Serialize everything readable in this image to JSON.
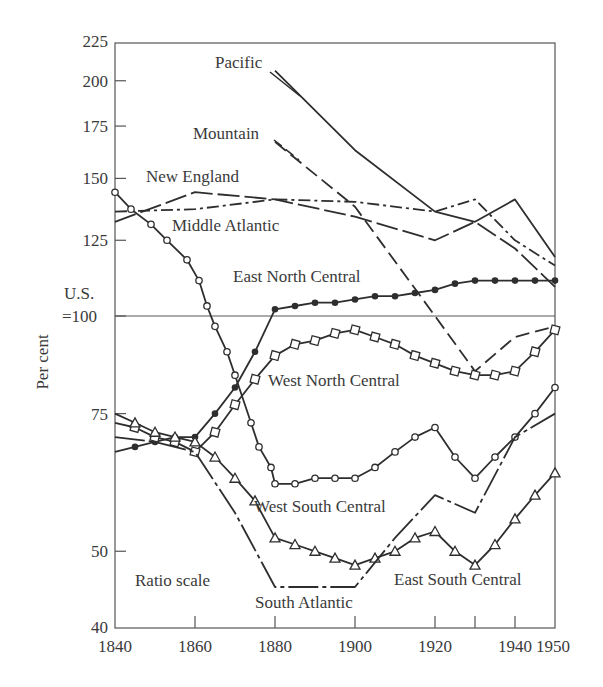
{
  "chart_data": {
    "type": "line",
    "title": "",
    "xlabel": "",
    "ylabel": "Per cent",
    "y_scale": "log",
    "scale_note": "Ratio scale",
    "reference_line": {
      "value": 100,
      "label_line1": "U.S.",
      "label_line2": "=100"
    },
    "xlim": [
      1840,
      1950
    ],
    "ylim": [
      40,
      225
    ],
    "x_ticks": [
      1840,
      1860,
      1880,
      1900,
      1920,
      1930,
      1940,
      1950
    ],
    "x_tick_labels": [
      "1840",
      "1860",
      "1880",
      "1900",
      "1920",
      "",
      "1940",
      "1950"
    ],
    "y_ticks": [
      40,
      50,
      75,
      100,
      125,
      150,
      175,
      200,
      225
    ],
    "y_tick_labels": [
      "40",
      "50",
      "75",
      "",
      "125",
      "150",
      "175",
      "200",
      "225"
    ],
    "grid": false,
    "legend": "inline labels",
    "series": [
      {
        "name": "Pacific",
        "style": "solid",
        "marker": "none",
        "x": [
          1880,
          1900,
          1920,
          1930,
          1940,
          1950
        ],
        "values": [
          206,
          163,
          136,
          132,
          141,
          119
        ]
      },
      {
        "name": "Mountain",
        "style": "long-dash",
        "marker": "none",
        "x": [
          1880,
          1900,
          1920,
          1930,
          1940,
          1950
        ],
        "values": [
          167,
          138,
          100,
          85,
          94,
          97
        ]
      },
      {
        "name": "New England",
        "style": "dash-dot",
        "marker": "none",
        "x": [
          1840,
          1860,
          1880,
          1900,
          1920,
          1930,
          1940,
          1950
        ],
        "values": [
          136,
          137,
          141,
          140,
          136,
          141,
          125,
          116
        ]
      },
      {
        "name": "Middle Atlantic",
        "style": "long-dash-solid",
        "marker": "none",
        "x": [
          1840,
          1860,
          1880,
          1900,
          1920,
          1930,
          1940,
          1950
        ],
        "values": [
          132,
          144,
          141,
          134,
          125,
          132,
          122,
          109
        ]
      },
      {
        "name": "East North Central",
        "style": "solid",
        "marker": "filled-circle",
        "x": [
          1840,
          1845,
          1850,
          1855,
          1860,
          1865,
          1870,
          1875,
          1880,
          1885,
          1890,
          1895,
          1900,
          1905,
          1910,
          1915,
          1920,
          1925,
          1930,
          1935,
          1940,
          1945,
          1950
        ],
        "values": [
          67,
          68,
          69,
          70,
          70,
          75,
          81,
          90,
          102,
          103,
          104,
          104,
          105,
          106,
          106,
          107,
          108,
          110,
          111,
          111,
          111,
          111,
          111
        ]
      },
      {
        "name": "West North Central",
        "style": "solid",
        "marker": "open-square",
        "x": [
          1840,
          1845,
          1850,
          1855,
          1860,
          1865,
          1870,
          1875,
          1880,
          1885,
          1890,
          1895,
          1900,
          1905,
          1910,
          1915,
          1920,
          1925,
          1930,
          1935,
          1940,
          1945,
          1950
        ],
        "values": [
          73,
          72,
          70,
          69,
          67,
          71,
          77,
          83,
          89,
          92,
          93,
          95,
          96,
          94,
          92,
          89,
          87,
          85,
          84,
          84,
          85,
          90,
          96
        ]
      },
      {
        "name": "West South Central",
        "style": "solid",
        "marker": "open-circle",
        "x": [
          1840,
          1844,
          1849,
          1853,
          1858,
          1861,
          1863,
          1865,
          1868,
          1870,
          1874,
          1876,
          1879,
          1880,
          1885,
          1890,
          1895,
          1900,
          1905,
          1910,
          1915,
          1920,
          1925,
          1930,
          1935,
          1940,
          1945,
          1950
        ],
        "values": [
          144,
          137,
          131,
          125,
          118,
          111,
          103,
          97,
          90,
          84,
          73,
          68,
          64,
          61,
          61,
          62,
          62,
          62,
          64,
          67,
          70,
          72,
          66,
          62,
          66,
          70,
          75,
          81
        ]
      },
      {
        "name": "East South Central",
        "style": "solid",
        "marker": "open-triangle",
        "x": [
          1840,
          1845,
          1850,
          1855,
          1860,
          1865,
          1870,
          1875,
          1880,
          1885,
          1890,
          1895,
          1900,
          1905,
          1910,
          1915,
          1920,
          1925,
          1930,
          1935,
          1940,
          1945,
          1950
        ],
        "values": [
          75,
          73,
          71,
          70,
          69,
          66,
          62,
          58,
          52,
          51,
          50,
          49,
          48,
          49,
          50,
          52,
          53,
          50,
          48,
          51,
          55,
          59,
          63
        ]
      },
      {
        "name": "South Atlantic",
        "style": "dash-solid",
        "marker": "none",
        "x": [
          1840,
          1850,
          1860,
          1870,
          1880,
          1890,
          1900,
          1910,
          1920,
          1930,
          1940,
          1950
        ],
        "values": [
          70,
          69,
          67,
          56,
          45,
          45,
          45,
          52,
          59,
          56,
          70,
          75
        ]
      }
    ],
    "annotations": [
      {
        "text": "Pacific",
        "x": 1864,
        "y": 212
      },
      {
        "text": "Mountain",
        "x": 1858,
        "y": 170
      },
      {
        "text": "New England",
        "x": 1848,
        "y": 150
      },
      {
        "text": "Middle Atlantic",
        "x": 1854,
        "y": 128
      },
      {
        "text": "East North Central",
        "x": 1869,
        "y": 110
      },
      {
        "text": "West North Central",
        "x": 1878,
        "y": 85
      },
      {
        "text": "West South Central",
        "x": 1877,
        "y": 57
      },
      {
        "text": "East South Central",
        "x": 1913,
        "y": 47
      },
      {
        "text": "South Atlantic",
        "x": 1875,
        "y": 42
      },
      {
        "text": "Ratio scale",
        "x": 1848,
        "y": 47
      }
    ]
  },
  "labels": {
    "ylabel": "Per cent",
    "us_line1": "U.S.",
    "us_line2": "=100",
    "ratio_scale": "Ratio scale",
    "pacific": "Pacific",
    "mountain": "Mountain",
    "new_england": "New England",
    "middle_atlantic": "Middle Atlantic",
    "east_north_central": "East North Central",
    "west_north_central": "West North Central",
    "west_south_central": "West South Central",
    "east_south_central": "East South Central",
    "south_atlantic": "South Atlantic"
  },
  "colors": {
    "ink": "#2e2e2e",
    "text": "#3a3a3a",
    "background": "#ffffff"
  }
}
